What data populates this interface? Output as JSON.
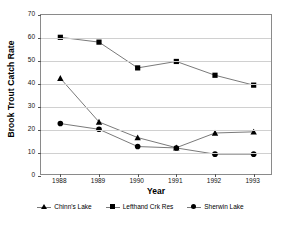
{
  "chart_data": {
    "type": "line",
    "title": "",
    "xlabel": "Year",
    "ylabel": "Brook Trout Catch Rate",
    "categories": [
      "1988",
      "1989",
      "1990",
      "1991",
      "1992",
      "1993"
    ],
    "x": [
      1988,
      1989,
      1990,
      1991,
      1992,
      1993
    ],
    "xlim": [
      1987.5,
      1993.5
    ],
    "ylim": [
      0,
      70
    ],
    "yticks": [
      0,
      10,
      20,
      30,
      40,
      50,
      60,
      70
    ],
    "grid": "horizontal",
    "legend_position": "bottom",
    "series": [
      {
        "name": "Chinn's Lake",
        "marker": "triangle",
        "color": "#000000",
        "values": [
          42.5,
          23.5,
          16.7,
          12.3,
          18.7,
          19.2
        ]
      },
      {
        "name": "Lefthand Crk Res",
        "marker": "square",
        "color": "#000000",
        "values": [
          60.3,
          58.2,
          47.0,
          49.8,
          43.8,
          39.5
        ]
      },
      {
        "name": "Sherwin Lake",
        "marker": "circle",
        "color": "#000000",
        "values": [
          22.8,
          20.3,
          12.8,
          12.2,
          9.5,
          9.5
        ]
      }
    ],
    "line_color": "#7a7a7a",
    "grid_color": "#d0d0d0",
    "axis_color": "#8a8a8a"
  }
}
